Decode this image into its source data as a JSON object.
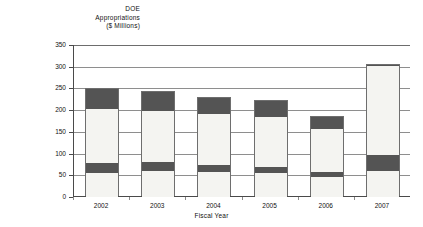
{
  "chart_data": {
    "type": "bar",
    "subtype": "stacked-bar",
    "title": "DOE Appropriations ($ Millions)",
    "title_lines": [
      "DOE",
      "Appropriations",
      "($ Millions)"
    ],
    "xlabel": "Fiscal Year",
    "ylabel": "DOE Appropriations ($ Millions)",
    "categories": [
      "2002",
      "2003",
      "2004",
      "2005",
      "2006",
      "2007"
    ],
    "ylim": [
      0,
      350
    ],
    "yticks": [
      0,
      50,
      100,
      150,
      200,
      250,
      300,
      350
    ],
    "ytick_labels": [
      "0",
      "50",
      "100",
      "150",
      "200",
      "250",
      "300",
      "350"
    ],
    "grid": true,
    "legend": false,
    "stack_order_bottom_to_top": [
      "segment-1",
      "segment-2",
      "segment-3",
      "segment-4"
    ],
    "series": [
      {
        "name": "segment-1",
        "shade": "light",
        "values": [
          55,
          60,
          58,
          55,
          47,
          61
        ]
      },
      {
        "name": "segment-2",
        "shade": "dark",
        "values": [
          23,
          21,
          16,
          14,
          11,
          36
        ]
      },
      {
        "name": "segment-3",
        "shade": "light",
        "values": [
          125,
          116,
          116,
          116,
          99,
          204
        ]
      },
      {
        "name": "segment-4",
        "shade": "dark",
        "values": [
          45,
          45,
          39,
          37,
          27,
          3
        ]
      }
    ],
    "totals": [
      248,
      242,
      229,
      222,
      184,
      304
    ],
    "bar_boundaries_bottom_to_top": [
      [
        0,
        55,
        78,
        203,
        248
      ],
      [
        0,
        60,
        81,
        197,
        242
      ],
      [
        0,
        58,
        74,
        190,
        229
      ],
      [
        0,
        55,
        69,
        185,
        222
      ],
      [
        0,
        47,
        58,
        157,
        184
      ],
      [
        0,
        61,
        97,
        301,
        304
      ]
    ],
    "colors": {
      "light_segment": "#f4f4f1",
      "dark_segment": "#545454",
      "bar_outline": "#6e6e6e",
      "gridline": "#8e8e8e",
      "axis": "#4a4a4a",
      "text": "#111111",
      "background": "#ffffff"
    }
  }
}
